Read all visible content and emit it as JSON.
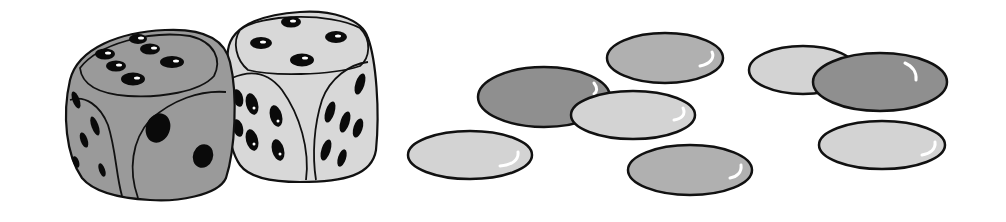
{
  "illustration": {
    "title": "Two dice and eight counters",
    "colors": {
      "outline": "#111111",
      "pip": "#0a0a0a",
      "dark_fill": "#8f8f8f",
      "medium_fill": "#b0b0b0",
      "light_fill": "#d3d3d3",
      "die_dark_fill": "#9a9a9a",
      "die_light_fill": "#d8d8d8",
      "highlight": "#ffffff",
      "background": "#ffffff"
    },
    "dice": [
      {
        "name": "dark-die",
        "top_face": 6,
        "front_face": 2,
        "side_face": 5,
        "fill": "dark"
      },
      {
        "name": "light-die",
        "top_face": 4,
        "front_face": 6,
        "side_face": 6,
        "fill": "light"
      }
    ],
    "counters": [
      {
        "name": "counter-1",
        "shade": "medium",
        "cx": 665,
        "cy": 58,
        "rx": 58,
        "ry": 25
      },
      {
        "name": "counter-2",
        "shade": "dark",
        "cx": 544,
        "cy": 97,
        "rx": 66,
        "ry": 30
      },
      {
        "name": "counter-3",
        "shade": "light",
        "cx": 633,
        "cy": 115,
        "rx": 62,
        "ry": 24
      },
      {
        "name": "counter-4",
        "shade": "light",
        "cx": 470,
        "cy": 155,
        "rx": 62,
        "ry": 24
      },
      {
        "name": "counter-5",
        "shade": "medium",
        "cx": 690,
        "cy": 170,
        "rx": 62,
        "ry": 25
      },
      {
        "name": "counter-6",
        "shade": "light",
        "cx": 803,
        "cy": 70,
        "rx": 54,
        "ry": 24
      },
      {
        "name": "counter-7",
        "shade": "dark",
        "cx": 880,
        "cy": 82,
        "rx": 67,
        "ry": 29
      },
      {
        "name": "counter-8",
        "shade": "light",
        "cx": 882,
        "cy": 145,
        "rx": 63,
        "ry": 24
      }
    ],
    "counter_count": 8,
    "dice_count": 2
  }
}
